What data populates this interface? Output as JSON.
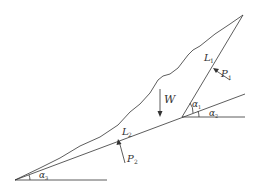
{
  "diagram": {
    "type": "slope-stability-wedge",
    "labels": {
      "W": "W",
      "L1": "L",
      "L1_sub": "1",
      "L2": "L",
      "L2_sub": "2",
      "P1": "P",
      "P1_sub": "1",
      "P2": "P",
      "P2_sub": "2",
      "alpha1": "α",
      "alpha1_sub": "1",
      "alpha2": "α",
      "alpha2_sub": "2",
      "alpha3": "α",
      "alpha3_sub": "3"
    },
    "colors": {
      "line": "#333333",
      "background": "#ffffff"
    }
  }
}
